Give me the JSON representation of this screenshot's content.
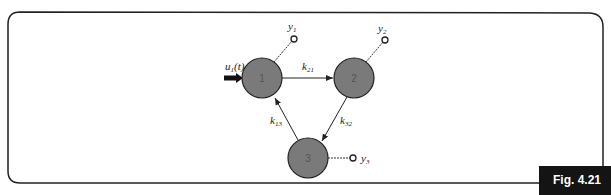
{
  "figure": {
    "label": "Fig. 4.21"
  },
  "nodes": [
    {
      "id": "1",
      "label": "1"
    },
    {
      "id": "2",
      "label": "2"
    },
    {
      "id": "3",
      "label": "3"
    }
  ],
  "input": {
    "label": "u",
    "sub": "1",
    "arg": "(t)"
  },
  "edges": [
    {
      "from": "1",
      "to": "2",
      "label": "k",
      "sub": "21"
    },
    {
      "from": "2",
      "to": "3",
      "label": "k",
      "sub": "32"
    },
    {
      "from": "3",
      "to": "1",
      "label": "k",
      "sub": "13"
    }
  ],
  "outputs": [
    {
      "node": "1",
      "label": "y",
      "sub": "1"
    },
    {
      "node": "2",
      "label": "y",
      "sub": "2"
    },
    {
      "node": "3",
      "label": "y",
      "sub": "3"
    }
  ],
  "colors": {
    "node_fill": "#7a7a7a",
    "stroke": "#222222",
    "fig_bg": "#141414"
  }
}
